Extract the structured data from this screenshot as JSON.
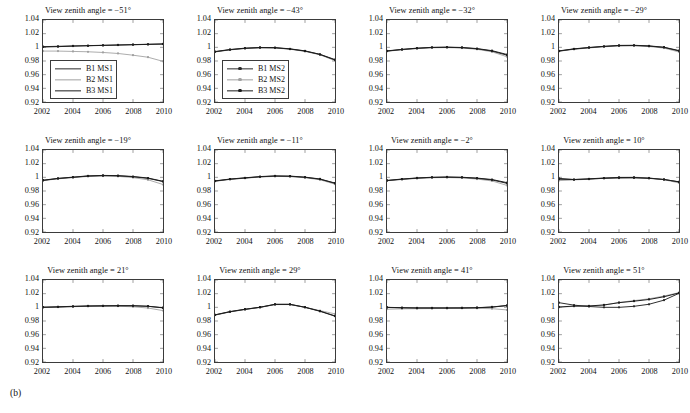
{
  "figure": {
    "subfigure_label": "(b)",
    "colors": {
      "b1": "#2a2a2a",
      "b2": "#a0a0a0",
      "b3": "#1c1c1c",
      "axis": "#3b3b3b",
      "background": "#ffffff"
    }
  },
  "chart_data": {
    "type": "line",
    "title": "(b)",
    "xlabel": "",
    "ylabel": "",
    "xlim": [
      2002,
      2010
    ],
    "ylim": [
      0.92,
      1.04
    ],
    "xticks": [
      2002,
      2004,
      2006,
      2008,
      2010
    ],
    "xtick_labels": [
      "2002",
      "2004",
      "2006",
      "2008",
      "2010"
    ],
    "yticks": [
      0.92,
      0.94,
      0.96,
      0.98,
      1,
      1.02,
      1.04
    ],
    "ytick_labels": [
      "0.92",
      "0.94",
      "0.96",
      "0.98",
      "1",
      "1.02",
      "1.04"
    ],
    "grid": false,
    "x": [
      2002,
      2003,
      2004,
      2005,
      2006,
      2007,
      2008,
      2009,
      2010
    ],
    "legend_position": "lower-left inside panels 1 and 2",
    "panels": [
      {
        "index": 0,
        "title": "View zenith angle = −51°",
        "angle": -51,
        "legend": {
          "visible": true,
          "markers": false,
          "entries": [
            "B1 MS1",
            "B2 MS1",
            "B3 MS1"
          ]
        },
        "series": [
          {
            "name": "B1 MS1",
            "color_key": "b1",
            "values": [
              1.001,
              1.0015,
              1.002,
              1.0025,
              1.003,
              1.0035,
              1.004,
              1.0045,
              1.005
            ]
          },
          {
            "name": "B2 MS1",
            "color_key": "b2",
            "values": [
              0.9945,
              0.9945,
              0.994,
              0.9935,
              0.9925,
              0.991,
              0.9885,
              0.9855,
              0.9795
            ]
          },
          {
            "name": "B3 MS1",
            "color_key": "b3",
            "values": [
              1.0005,
              1.001,
              1.0018,
              1.0023,
              1.0028,
              1.0033,
              1.0038,
              1.0043,
              1.0048
            ]
          }
        ]
      },
      {
        "index": 1,
        "title": "View zenith angle = −43°",
        "angle": -43,
        "legend": {
          "visible": true,
          "markers": true,
          "entries": [
            "B1 MS2",
            "B2 MS2",
            "B3 MS2"
          ]
        },
        "series": [
          {
            "name": "B1 MS2",
            "color_key": "b1",
            "values": [
              0.9935,
              0.9965,
              0.9985,
              0.9995,
              0.9993,
              0.9975,
              0.9945,
              0.9895,
              0.9815
            ]
          },
          {
            "name": "B2 MS2",
            "color_key": "b2",
            "values": [
              0.9932,
              0.9962,
              0.9982,
              0.9992,
              0.999,
              0.9972,
              0.994,
              0.989,
              0.9805
            ]
          },
          {
            "name": "B3 MS2",
            "color_key": "b3",
            "values": [
              0.9938,
              0.9968,
              0.9988,
              0.9998,
              0.9996,
              0.9978,
              0.9948,
              0.9898,
              0.982
            ]
          }
        ]
      },
      {
        "index": 2,
        "title": "View zenith angle = −32°",
        "angle": -32,
        "legend": {
          "visible": false,
          "markers": true,
          "entries": []
        },
        "series": [
          {
            "name": "B1",
            "color_key": "b1",
            "values": [
              0.9945,
              0.9968,
              0.9985,
              0.9997,
              1.0,
              0.9995,
              0.9978,
              0.9945,
              0.9885
            ]
          },
          {
            "name": "B2",
            "color_key": "b2",
            "values": [
              0.9942,
              0.9964,
              0.9981,
              0.9993,
              0.9996,
              0.999,
              0.9971,
              0.9934,
              0.9862
            ]
          },
          {
            "name": "B3",
            "color_key": "b3",
            "values": [
              0.9948,
              0.997,
              0.9988,
              1.0,
              1.0003,
              0.9998,
              0.9982,
              0.9951,
              0.9895
            ]
          }
        ]
      },
      {
        "index": 3,
        "title": "View zenith angle = −29°",
        "angle": -29,
        "legend": {
          "visible": false,
          "markers": true,
          "entries": []
        },
        "series": [
          {
            "name": "B1",
            "color_key": "b1",
            "values": [
              0.9945,
              0.9975,
              0.9995,
              1.0012,
              1.0025,
              1.0027,
              1.0018,
              0.9998,
              0.9948
            ]
          },
          {
            "name": "B2",
            "color_key": "b2",
            "values": [
              0.9942,
              0.9971,
              0.9991,
              1.0008,
              1.002,
              1.0022,
              1.0012,
              0.9989,
              0.9932
            ]
          },
          {
            "name": "B3",
            "color_key": "b3",
            "values": [
              0.9948,
              0.9978,
              0.9998,
              1.0015,
              1.0028,
              1.003,
              1.0021,
              1.0002,
              0.9952
            ]
          }
        ]
      },
      {
        "index": 4,
        "title": "View zenith angle = −19°",
        "angle": -19,
        "legend": {
          "visible": false,
          "markers": true,
          "entries": []
        },
        "series": [
          {
            "name": "B1",
            "color_key": "b1",
            "values": [
              0.9955,
              0.9982,
              1.0,
              1.0018,
              1.0025,
              1.0022,
              1.0008,
              0.9985,
              0.9938
            ]
          },
          {
            "name": "B2",
            "color_key": "b2",
            "values": [
              0.9952,
              0.9978,
              0.9996,
              1.0013,
              1.0019,
              1.0014,
              0.9996,
              0.9964,
              0.9895
            ]
          },
          {
            "name": "B3",
            "color_key": "b3",
            "values": [
              0.9958,
              0.9985,
              1.0003,
              1.0021,
              1.0028,
              1.0025,
              1.0012,
              0.999,
              0.9942
            ]
          }
        ]
      },
      {
        "index": 5,
        "title": "View zenith angle = −11°",
        "angle": -11,
        "legend": {
          "visible": false,
          "markers": true,
          "entries": []
        },
        "series": [
          {
            "name": "B1",
            "color_key": "b1",
            "values": [
              0.9945,
              0.9972,
              0.999,
              1.0008,
              1.0018,
              1.0015,
              1.0,
              0.9972,
              0.9912
            ]
          },
          {
            "name": "B2",
            "color_key": "b2",
            "values": [
              0.9942,
              0.9969,
              0.9987,
              1.0004,
              1.0014,
              1.001,
              0.9994,
              0.9964,
              0.99
            ]
          },
          {
            "name": "B3",
            "color_key": "b3",
            "values": [
              0.9948,
              0.9975,
              0.9993,
              1.0011,
              1.0021,
              1.0018,
              1.0003,
              0.9976,
              0.9916
            ]
          }
        ]
      },
      {
        "index": 6,
        "title": "View zenith angle = −2°",
        "angle": -2,
        "legend": {
          "visible": false,
          "markers": true,
          "entries": []
        },
        "series": [
          {
            "name": "B1",
            "color_key": "b1",
            "values": [
              0.9952,
              0.9972,
              0.9988,
              0.9998,
              1.0002,
              0.9998,
              0.9985,
              0.9962,
              0.9912
            ]
          },
          {
            "name": "B2",
            "color_key": "b2",
            "values": [
              0.995,
              0.9968,
              0.9984,
              0.9994,
              0.9997,
              0.9991,
              0.9975,
              0.9947,
              0.9882
            ]
          },
          {
            "name": "B3",
            "color_key": "b3",
            "values": [
              0.9955,
              0.9975,
              0.9991,
              1.0001,
              1.0005,
              1.0001,
              0.9989,
              0.9968,
              0.9922
            ]
          }
        ]
      },
      {
        "index": 7,
        "title": "View zenith angle = 10°",
        "angle": 10,
        "legend": {
          "visible": false,
          "markers": true,
          "entries": []
        },
        "series": [
          {
            "name": "B1",
            "color_key": "b1",
            "values": [
              0.9985,
              0.9968,
              0.9975,
              0.9985,
              0.999,
              0.9992,
              0.9985,
              0.9968,
              0.9935
            ]
          },
          {
            "name": "B2",
            "color_key": "b2",
            "values": [
              0.9952,
              0.9962,
              0.9972,
              0.9988,
              1.0,
              1.0002,
              0.9992,
              0.9965,
              0.9918
            ]
          },
          {
            "name": "B3",
            "color_key": "b3",
            "values": [
              0.9972,
              0.9968,
              0.9978,
              0.999,
              0.9998,
              0.9998,
              0.9988,
              0.9969,
              0.9932
            ]
          }
        ]
      },
      {
        "index": 8,
        "title": "View zenith angle = 21°",
        "angle": 21,
        "legend": {
          "visible": false,
          "markers": true,
          "entries": []
        },
        "series": [
          {
            "name": "B1",
            "color_key": "b1",
            "values": [
              1.0,
              1.0005,
              1.0012,
              1.0018,
              1.002,
              1.0022,
              1.0022,
              1.0015,
              0.9992
            ]
          },
          {
            "name": "B2",
            "color_key": "b2",
            "values": [
              0.9998,
              1.0002,
              1.0009,
              1.0015,
              1.0017,
              1.0016,
              1.0008,
              0.999,
              0.9952
            ]
          },
          {
            "name": "B3",
            "color_key": "b3",
            "values": [
              1.0002,
              1.0008,
              1.0015,
              1.002,
              1.0023,
              1.0025,
              1.0024,
              1.0016,
              0.9995
            ]
          }
        ]
      },
      {
        "index": 9,
        "title": "View zenith angle = 29°",
        "angle": 29,
        "legend": {
          "visible": false,
          "markers": true,
          "entries": []
        },
        "series": [
          {
            "name": "B1",
            "color_key": "b1",
            "values": [
              0.9888,
              0.9935,
              0.997,
              1.0,
              1.0042,
              1.0042,
              1.0,
              0.9942,
              0.987
            ]
          },
          {
            "name": "B2",
            "color_key": "b2",
            "values": [
              0.9885,
              0.9932,
              0.9968,
              0.9998,
              1.004,
              1.004,
              1.0,
              0.9952,
              0.9905
            ]
          },
          {
            "name": "B3",
            "color_key": "b3",
            "values": [
              0.989,
              0.9938,
              0.9972,
              1.0002,
              1.0045,
              1.0045,
              1.0002,
              0.9945,
              0.9875
            ]
          }
        ]
      },
      {
        "index": 10,
        "title": "View zenith angle = 41°",
        "angle": 41,
        "legend": {
          "visible": false,
          "markers": true,
          "entries": []
        },
        "series": [
          {
            "name": "B1",
            "color_key": "b1",
            "values": [
              1.0,
              0.9995,
              0.9992,
              0.9992,
              0.9992,
              0.9992,
              0.9995,
              1.0005,
              1.0028
            ]
          },
          {
            "name": "B2",
            "color_key": "b2",
            "values": [
              0.9972,
              0.9978,
              0.998,
              0.9982,
              0.9984,
              0.9985,
              0.9985,
              0.998,
              0.9962
            ]
          },
          {
            "name": "B3",
            "color_key": "b3",
            "values": [
              0.9998,
              0.9993,
              0.999,
              0.999,
              0.999,
              0.9991,
              0.9994,
              1.0003,
              1.0025
            ]
          }
        ]
      },
      {
        "index": 11,
        "title": "View zenith angle = 51°",
        "angle": 51,
        "legend": {
          "visible": false,
          "markers": true,
          "entries": []
        },
        "series": [
          {
            "name": "B1",
            "color_key": "b1",
            "values": [
              1.0068,
              1.0032,
              1.0012,
              1.0,
              1.0,
              1.0015,
              1.0045,
              1.0105,
              1.0205
            ]
          },
          {
            "name": "B2",
            "color_key": "b2",
            "values": [
              1.0,
              1.0015,
              1.0018,
              1.0032,
              1.0072,
              1.0098,
              1.0125,
              1.0165,
              1.0215
            ]
          },
          {
            "name": "B3",
            "color_key": "b3",
            "values": [
              1.0005,
              1.0018,
              1.002,
              1.0035,
              1.0068,
              1.009,
              1.0115,
              1.0155,
              1.021
            ]
          }
        ]
      }
    ]
  }
}
